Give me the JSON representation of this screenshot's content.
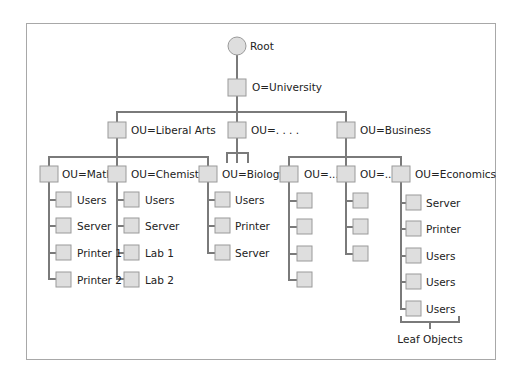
{
  "diagram": {
    "root": {
      "label": "Root"
    },
    "org": {
      "label": "O=University"
    },
    "level1": [
      {
        "label": "OU=Liberal Arts"
      },
      {
        "label": "OU=. . . ."
      },
      {
        "label": "OU=Business"
      }
    ],
    "level2": [
      {
        "label": "OU=Math",
        "leaves": [
          "Users",
          "Server",
          "Printer 1",
          "Printer 2"
        ]
      },
      {
        "label": "OU=Chemistry",
        "leaves": [
          "Users",
          "Server",
          "Lab 1",
          "Lab 2"
        ]
      },
      {
        "label": "OU=Biology",
        "leaves": [
          "Users",
          "Printer",
          "Server"
        ]
      },
      {
        "label": "OU=...",
        "leaves": [
          "",
          "",
          "",
          ""
        ]
      },
      {
        "label": "OU=...",
        "leaves": [
          "",
          "",
          ""
        ]
      },
      {
        "label": "OU=Economics",
        "leaves": [
          "Server",
          "Printer",
          "Users",
          "Users",
          "Users"
        ]
      }
    ],
    "annotation": {
      "label": "Leaf Objects"
    }
  },
  "colors": {
    "node_fill": "#dedede",
    "node_stroke": "#9a9a9a",
    "line": "#7a7a7a",
    "frame": "#a8a8a8",
    "text": "#222222"
  }
}
